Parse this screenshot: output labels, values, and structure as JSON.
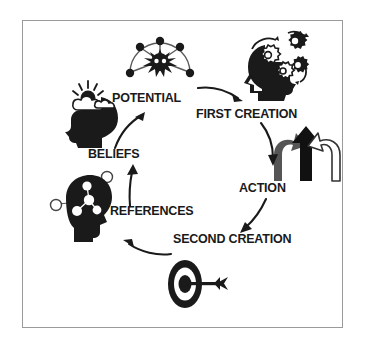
{
  "diagram": {
    "frame": {
      "border_color": "#9a9a9a",
      "background": "#ffffff"
    },
    "palette": {
      "ink": "#1a1a1a",
      "gray_arrow": "#555555",
      "outline_arrow": "#333333",
      "border": "#9a9a9a"
    },
    "nodes": [
      {
        "id": "potential",
        "label": "POTENTIAL",
        "icon": "radial-burst-icon",
        "label_x": 112,
        "label_y": 92,
        "icon_x": 124,
        "icon_y": 33
      },
      {
        "id": "first-creation",
        "label": "FIRST CREATION",
        "icon": "head-with-gears-icon",
        "label_x": 196,
        "label_y": 108,
        "icon_x": 238,
        "icon_y": 27
      },
      {
        "id": "action",
        "label": "ACTION",
        "icon": "three-arrows-icon",
        "label_x": 239,
        "label_y": 182,
        "icon_x": 272,
        "icon_y": 125
      },
      {
        "id": "second-creation",
        "label": "SECOND CREATION",
        "icon": "bullseye-target-icon",
        "label_x": 173,
        "label_y": 233,
        "icon_x": 162,
        "icon_y": 258
      },
      {
        "id": "references",
        "label": "REFERENCES",
        "icon": "head-with-network-icon",
        "label_x": 110,
        "label_y": 205,
        "icon_x": 50,
        "icon_y": 168
      },
      {
        "id": "beliefs",
        "label": "BELIEFS",
        "icon": "head-with-clouds-sun-icon",
        "label_x": 88,
        "label_y": 148,
        "icon_x": 58,
        "icon_y": 78
      }
    ],
    "connectors": [
      {
        "id": "beliefs-to-potential",
        "from": "beliefs",
        "to": "potential",
        "style": "curved-arrow"
      },
      {
        "id": "potential-to-first-creation",
        "from": "potential",
        "to": "first-creation",
        "style": "curved-arrow"
      },
      {
        "id": "first-creation-to-action",
        "from": "first-creation",
        "to": "action",
        "style": "curved-arrow"
      },
      {
        "id": "action-to-second-creation",
        "from": "action",
        "to": "second-creation",
        "style": "curved-arrow"
      },
      {
        "id": "second-creation-to-references",
        "from": "second-creation",
        "to": "references",
        "style": "curved-arrow"
      },
      {
        "id": "references-to-beliefs",
        "from": "references",
        "to": "beliefs",
        "style": "curved-arrow"
      }
    ]
  }
}
